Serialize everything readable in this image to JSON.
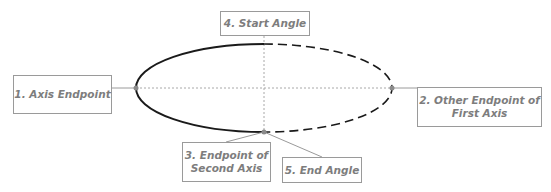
{
  "diagram": {
    "title": "",
    "ellipse": {
      "center": [
        264,
        88
      ],
      "rx": 128,
      "ry": 44,
      "solid_half": "left",
      "dashed_half": "right",
      "stroke_color": "#1a1a1a"
    },
    "guides": {
      "horizontal_axis": "dotted",
      "vertical_axis": "dotted",
      "color": "#a8a8a8"
    },
    "labels": [
      {
        "id": "axis-endpoint",
        "text": "1. Axis Endpoint"
      },
      {
        "id": "other-endpoint",
        "text": "2. Other Endpoint of First Axis",
        "line1": "2. Other Endpoint of",
        "line2": "First Axis"
      },
      {
        "id": "second-axis-endpoint",
        "text": "3. Endpoint of Second Axis",
        "line1": "3. Endpoint of",
        "line2": "Second Axis"
      },
      {
        "id": "start-angle",
        "text": "4. Start Angle"
      },
      {
        "id": "end-angle",
        "text": "5. End Angle"
      }
    ],
    "colors": {
      "label_text": "#7d7d7d",
      "label_border": "#9a9a9a",
      "connector": "#9a9a9a",
      "point": "#8a8a8a"
    }
  }
}
